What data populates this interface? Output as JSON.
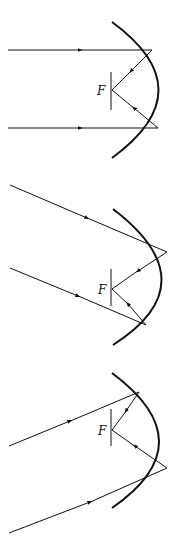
{
  "colors": {
    "ink": "#111111",
    "background": "#ffffff"
  },
  "diagrams": [
    {
      "focus_label": "F",
      "description": "Parallel rays along axis reflect through focus"
    },
    {
      "focus_label": "F",
      "description": "Oblique parallel rays, angled downward"
    },
    {
      "focus_label": "F",
      "description": "Oblique parallel rays, angled upward"
    }
  ]
}
